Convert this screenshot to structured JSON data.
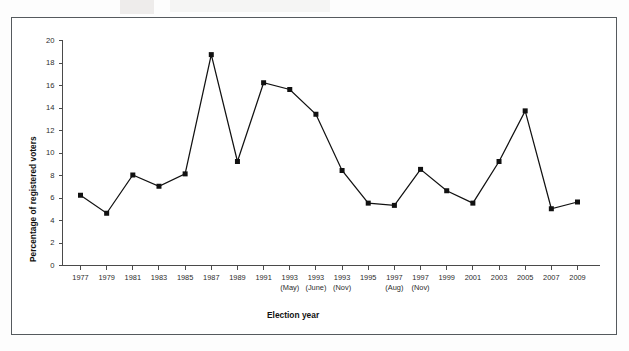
{
  "figure": {
    "background_color": "#ffffff",
    "border_color": "#555a5e",
    "line_color": "#111111",
    "marker_color": "#111111",
    "axis_color": "#4a4a4a"
  },
  "chart_data": {
    "type": "line",
    "title": "",
    "xlabel": "Election year",
    "ylabel": "Percentage of registered voters",
    "ylim": [
      0,
      20
    ],
    "ytick_values": [
      0,
      2,
      4,
      6,
      8,
      10,
      12,
      14,
      16,
      18,
      20
    ],
    "ytick_labels": [
      "0",
      "2",
      "4",
      "6",
      "8",
      "10",
      "12",
      "14",
      "16",
      "18",
      "20"
    ],
    "grid": false,
    "legend": "none",
    "marker": "square",
    "categories": [
      "1977",
      "1979",
      "1981",
      "1983",
      "1985",
      "1987",
      "1989",
      "1991",
      "1993",
      "1993",
      "1993",
      "1995",
      "1997",
      "1997",
      "1999",
      "2001",
      "2003",
      "2005",
      "2007",
      "2009"
    ],
    "category_sublabels": [
      "",
      "",
      "",
      "",
      "",
      "",
      "",
      "",
      "(May)",
      "(June)",
      "(Nov)",
      "",
      "(Aug)",
      "(Nov)",
      "",
      "",
      "",
      "",
      "",
      ""
    ],
    "values": [
      6.2,
      4.6,
      8.0,
      7.0,
      8.1,
      18.7,
      9.2,
      16.2,
      15.6,
      13.4,
      8.4,
      5.5,
      5.3,
      8.5,
      6.6,
      5.5,
      9.2,
      13.7,
      5.0,
      5.6
    ]
  }
}
